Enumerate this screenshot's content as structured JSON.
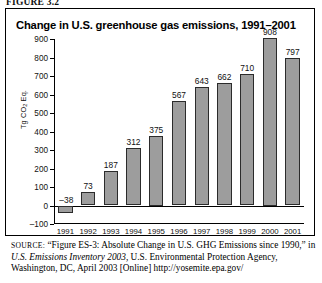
{
  "figure": {
    "label": "FIGURE 3.2"
  },
  "chart": {
    "title": "Change in U.S. greenhouse gas emissions, 1991–2001",
    "axis_title_main": "Tg CO",
    "axis_title_sub": "2",
    "axis_title_tail": " Eq."
  },
  "chart_data": {
    "type": "bar",
    "title": "Change in U.S. greenhouse gas emissions, 1991–2001",
    "xlabel": "",
    "ylabel": "Tg CO2 Eq.",
    "categories": [
      "1991",
      "1992",
      "1993",
      "1994",
      "1995",
      "1996",
      "1997",
      "1998",
      "1999",
      "2000",
      "2001"
    ],
    "values": [
      -38,
      73,
      187,
      312,
      375,
      567,
      643,
      662,
      710,
      908,
      797
    ],
    "value_labels": [
      "–38",
      "73",
      "187",
      "312",
      "375",
      "567",
      "643",
      "662",
      "710",
      "908",
      "797"
    ],
    "ylim": [
      -100,
      900
    ],
    "yticks": [
      900,
      800,
      700,
      600,
      500,
      400,
      300,
      200,
      100,
      0,
      -100
    ],
    "ytick_labels": [
      "900",
      "800",
      "700",
      "600",
      "500",
      "400",
      "300",
      "200",
      "100",
      "0",
      "–100"
    ],
    "grid": false,
    "legend": null,
    "bar_color": "#9d9d9d",
    "bar_edge_color": "#2b2b2b",
    "axis_color": "#000000"
  },
  "source": {
    "prefix": "SOURCE:",
    "part1": " “Figure ES-3: Absolute Change in U.S. GHG Emissions since 1990,” in ",
    "italic1": "U.S. Emissions Inventory 2003,",
    "part2": " U.S. Environmental Protection Agency, Washington, DC, April 2003 [Online] http://yosemite.epa.gov/"
  }
}
